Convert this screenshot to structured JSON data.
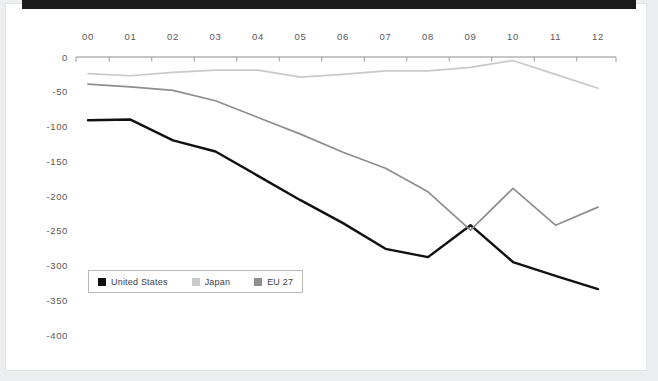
{
  "theme": {
    "page_background": "#edeef0",
    "card_background": "#ffffff",
    "top_bar_color": "#1b1b1b",
    "axis_color": "#8d8d8d",
    "label_color": "#58585a"
  },
  "legend": {
    "position": "inside-bottom-left",
    "items": [
      {
        "label": "United States",
        "color": "#111111"
      },
      {
        "label": "Japan",
        "color": "#c9c9c9"
      },
      {
        "label": "EU 27",
        "color": "#8e8e8e"
      }
    ]
  },
  "chart_data": {
    "type": "line",
    "title": "",
    "subtitle": "",
    "xlabel": "",
    "ylabel": "",
    "grid": false,
    "legend_position": "inside-bottom-left",
    "x": [
      "00",
      "01",
      "02",
      "03",
      "04",
      "05",
      "06",
      "07",
      "08",
      "09",
      "10",
      "11",
      "12"
    ],
    "categories": [
      "00",
      "01",
      "02",
      "03",
      "04",
      "05",
      "06",
      "07",
      "08",
      "09",
      "10",
      "11",
      "12"
    ],
    "xtick_labels": [
      "00",
      "01",
      "02",
      "03",
      "04",
      "05",
      "06",
      "07",
      "08",
      "09",
      "10",
      "11",
      "12"
    ],
    "ytick_labels": [
      "0",
      "-50",
      "-100",
      "-150",
      "-200",
      "-250",
      "-300",
      "-350",
      "-400"
    ],
    "yticks": [
      0,
      -50,
      -100,
      -150,
      -200,
      -250,
      -300,
      -350,
      -400
    ],
    "ylim": [
      -400,
      0
    ],
    "series": [
      {
        "name": "United States",
        "color": "#111111",
        "width": 2.4,
        "values": [
          -91,
          -90,
          -120,
          -136,
          -171,
          -206,
          -239,
          -276,
          -288,
          -242,
          -295,
          -315,
          -334
        ]
      },
      {
        "name": "Japan",
        "color": "#c9c9c9",
        "width": 1.7,
        "values": [
          -24,
          -27,
          -22,
          -19,
          -19,
          -29,
          -25,
          -20,
          -20,
          -15,
          -5,
          -25,
          -45
        ]
      },
      {
        "name": "EU 27",
        "color": "#8e8e8e",
        "width": 1.7,
        "values": [
          -39,
          -43,
          -48,
          -63,
          -87,
          -111,
          -137,
          -160,
          -194,
          -249,
          -189,
          -242,
          -216
        ]
      }
    ]
  }
}
